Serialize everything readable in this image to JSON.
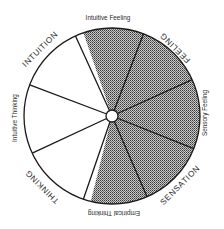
{
  "diagram": {
    "type": "circular-typology-wheel",
    "center": [
      112,
      116
    ],
    "radius": 88,
    "colors": {
      "stroke": "#1a1a1a",
      "shaded_fill": "#8a8a8a",
      "unshaded_fill": "#ffffff",
      "text": "#2a2a2a"
    },
    "labels": {
      "intuitive_feeling": "Intuitive Feeling",
      "feeling": "FEELING",
      "sensory_feeling": "Sensory Feeling",
      "sensation": "SENSATION",
      "empirical_thinking": "Empirical Thinking",
      "thinking": "THINKING",
      "intuitive_thinking": "Intuitive Thinking",
      "intuition": "INTUITION"
    },
    "segments": [
      {
        "name": "Intuitive Feeling",
        "shaded": true
      },
      {
        "name": "Feeling",
        "shaded": true
      },
      {
        "name": "Sensory Feeling",
        "shaded": true
      },
      {
        "name": "Sensation",
        "shaded": true
      },
      {
        "name": "Empirical Thinking",
        "shaded": true
      },
      {
        "name": "Thinking",
        "shaded": false
      },
      {
        "name": "Intuitive Thinking",
        "shaded": false
      },
      {
        "name": "Intuition",
        "shaded": false
      }
    ]
  }
}
